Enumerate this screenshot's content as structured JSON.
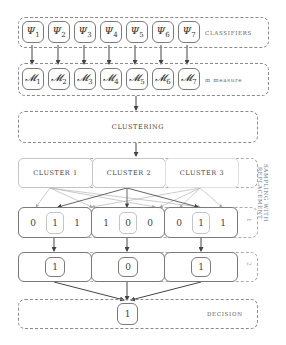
{
  "diagram": {
    "classifiers": {
      "label": "Classifiers",
      "items": [
        {
          "sym": "Ψ",
          "sub": "1"
        },
        {
          "sym": "Ψ",
          "sub": "2"
        },
        {
          "sym": "Ψ",
          "sub": "3"
        },
        {
          "sym": "Ψ",
          "sub": "4"
        },
        {
          "sym": "Ψ",
          "sub": "5"
        },
        {
          "sym": "Ψ",
          "sub": "6"
        },
        {
          "sym": "Ψ",
          "sub": "7"
        }
      ]
    },
    "measures": {
      "label": "m measure",
      "items": [
        {
          "sym": "𝓜",
          "sub": "1"
        },
        {
          "sym": "𝓜",
          "sub": "2"
        },
        {
          "sym": "𝓜",
          "sub": "3"
        },
        {
          "sym": "𝓜",
          "sub": "4"
        },
        {
          "sym": "𝓜",
          "sub": "5"
        },
        {
          "sym": "𝓜",
          "sub": "6"
        },
        {
          "sym": "𝓜",
          "sub": "7"
        }
      ]
    },
    "clustering": {
      "label": "Clustering"
    },
    "clusters": {
      "items": [
        "Cluster 1",
        "Cluster 2",
        "Cluster 3"
      ],
      "side_label_line1": "Sampling with",
      "side_label_line2": "replacement"
    },
    "samples": {
      "groups": [
        [
          "0",
          "1",
          "1"
        ],
        [
          "1",
          "0",
          "0"
        ],
        [
          "0",
          "1",
          "1"
        ]
      ],
      "side_label": "1"
    },
    "votes": {
      "items": [
        "1",
        "0",
        "1"
      ],
      "side_label": "2"
    },
    "decision": {
      "value": "1",
      "label": "Decision"
    }
  }
}
